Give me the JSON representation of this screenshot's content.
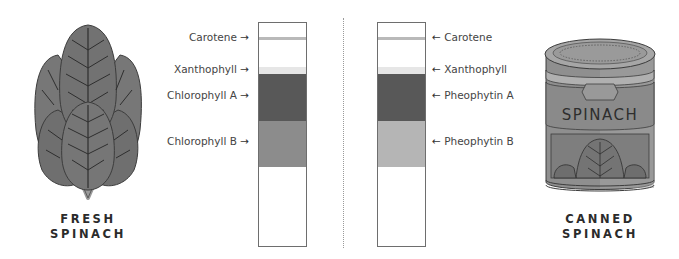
{
  "left_panel": {
    "caption_line1": "FRESH",
    "caption_line2": "SPINACH",
    "icon": "spinach-leaves-icon"
  },
  "right_panel": {
    "caption_line1": "CANNED",
    "caption_line2": "SPINACH",
    "icon": "spinach-can-icon",
    "can_label": "SPINACH"
  },
  "fresh_column": {
    "bands": [
      {
        "name": "Carotene",
        "label": "Carotene",
        "arrow": "→",
        "top": 14,
        "height": 3,
        "color": "#b9b9b9"
      },
      {
        "name": "Xanthophyll",
        "label": "Xanthophyll",
        "arrow": "→",
        "top": 44,
        "height": 7,
        "color": "#e6e6e6"
      },
      {
        "name": "Chlorophyll A",
        "label": "Chlorophyll A",
        "arrow": "→",
        "top": 51,
        "height": 47,
        "color": "#585858"
      },
      {
        "name": "Chlorophyll B",
        "label": "Chlorophyll B",
        "arrow": "→",
        "top": 98,
        "height": 46,
        "color": "#8c8c8c"
      }
    ]
  },
  "canned_column": {
    "bands": [
      {
        "name": "Carotene",
        "label": "Carotene",
        "arrow": "←",
        "top": 14,
        "height": 3,
        "color": "#b9b9b9"
      },
      {
        "name": "Xanthophyll",
        "label": "Xanthophyll",
        "arrow": "←",
        "top": 44,
        "height": 7,
        "color": "#e6e6e6"
      },
      {
        "name": "Pheophytin A",
        "label": "Pheophytin A",
        "arrow": "←",
        "top": 51,
        "height": 47,
        "color": "#585858"
      },
      {
        "name": "Pheophytin B",
        "label": "Pheophytin B",
        "arrow": "←",
        "top": 98,
        "height": 46,
        "color": "#b5b5b5"
      }
    ]
  },
  "colors": {
    "leaf": "#7a7a7a",
    "leaf_dark": "#5f5f5f",
    "can_body": "#8f8f8f",
    "can_light": "#b0b0b0",
    "outline": "#3c3c3c"
  }
}
